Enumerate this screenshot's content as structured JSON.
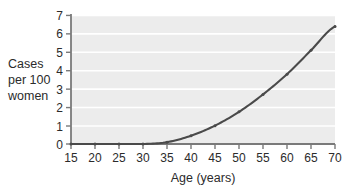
{
  "chart_data": {
    "type": "line",
    "title": "",
    "xlabel": "Age (years)",
    "ylabel": "Cases per 100 women",
    "ylabel_lines": [
      "Cases",
      "per 100",
      "women"
    ],
    "x": [
      15,
      20,
      25,
      30,
      35,
      40,
      45,
      50,
      55,
      60,
      65,
      70
    ],
    "values": [
      0,
      0,
      0,
      0,
      0.1,
      0.45,
      1.0,
      1.75,
      2.7,
      3.8,
      5.1,
      6.4
    ],
    "series": [
      {
        "name": "Cases per 100 women",
        "values": [
          0,
          0,
          0,
          0,
          0.1,
          0.45,
          1.0,
          1.75,
          2.7,
          3.8,
          5.1,
          6.4
        ]
      }
    ],
    "xticks": [
      15,
      20,
      25,
      30,
      35,
      40,
      45,
      50,
      55,
      60,
      65,
      70
    ],
    "xtick_labels": [
      "15",
      "20",
      "25",
      "30",
      "35",
      "40",
      "45",
      "50",
      "55",
      "60",
      "65",
      "70"
    ],
    "yticks": [
      0,
      1,
      2,
      3,
      4,
      5,
      6,
      7
    ],
    "ytick_labels": [
      "0",
      "1",
      "2",
      "3",
      "4",
      "5",
      "6",
      "7"
    ],
    "xlim": [
      15,
      70
    ],
    "ylim": [
      0,
      7
    ],
    "grid": "horizontal",
    "legend": "none",
    "markers": true,
    "colors": {
      "line": "#4a4a4a",
      "axis": "#7a7a7a",
      "plot_background": "#ececec",
      "gridline": "#ffffff",
      "text": "#2b2b2b",
      "page_background": "#ffffff"
    }
  }
}
